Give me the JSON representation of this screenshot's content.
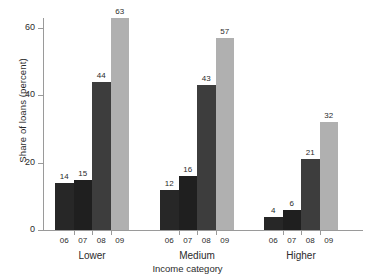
{
  "chart_data": {
    "type": "bar",
    "title": "",
    "xlabel": "Income category",
    "ylabel": "Share of loans (percent)",
    "categories": [
      "Lower",
      "Medium",
      "Higher"
    ],
    "series": [
      {
        "name": "06",
        "values": [
          14,
          12,
          4
        ],
        "color": "#272727"
      },
      {
        "name": "07",
        "values": [
          15,
          16,
          6
        ],
        "color": "#1f1f1f"
      },
      {
        "name": "08",
        "values": [
          44,
          43,
          21
        ],
        "color": "#3d3d3d"
      },
      {
        "name": "09",
        "values": [
          63,
          57,
          32
        ],
        "color": "#b0b0b0"
      }
    ],
    "ylim": [
      0,
      68
    ],
    "yticks": [
      0,
      20,
      40,
      60
    ],
    "ytick_labels": [
      "0",
      "20",
      "40",
      "60"
    ],
    "grid": false,
    "legend": "none",
    "bar_labels": [
      [
        "14",
        "15",
        "44",
        "63"
      ],
      [
        "12",
        "16",
        "43",
        "57"
      ],
      [
        "4",
        "6",
        "21",
        "32"
      ]
    ],
    "year_labels": [
      "06",
      "07",
      "08",
      "09"
    ]
  },
  "axes": {
    "axis_color": "#9a9a9a"
  }
}
